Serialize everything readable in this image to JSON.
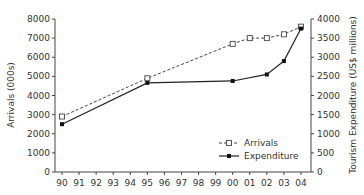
{
  "chart_data": {
    "type": "line",
    "title": "",
    "x": [
      "90",
      "91",
      "92",
      "93",
      "94",
      "95",
      "96",
      "97",
      "98",
      "99",
      "00",
      "01",
      "02",
      "03",
      "04"
    ],
    "xlabel": "",
    "ylabel": "Arrivals (000s)",
    "y2label": "Tourism Expenditure (US$ millions)",
    "ylim": [
      0,
      8000
    ],
    "y2lim": [
      0,
      4000
    ],
    "yticks": [
      0,
      1000,
      2000,
      3000,
      4000,
      5000,
      6000,
      7000,
      8000
    ],
    "y2ticks": [
      0,
      500,
      1000,
      1500,
      2000,
      2500,
      3000,
      3500,
      4000
    ],
    "grid": false,
    "legend_position": "lower right",
    "series": [
      {
        "name": "Arrivals",
        "axis": "left",
        "style": "dashed-open-square",
        "points": [
          [
            "90",
            2900
          ],
          [
            "95",
            4900
          ],
          [
            "00",
            6700
          ],
          [
            "01",
            7000
          ],
          [
            "02",
            7000
          ],
          [
            "03",
            7200
          ],
          [
            "04",
            7600
          ]
        ]
      },
      {
        "name": "Expenditure",
        "axis": "right",
        "style": "solid-filled-square",
        "points": [
          [
            "90",
            1250
          ],
          [
            "95",
            2330
          ],
          [
            "00",
            2380
          ],
          [
            "02",
            2550
          ],
          [
            "03",
            2900
          ],
          [
            "04",
            3750
          ]
        ]
      }
    ]
  },
  "legend": {
    "arrivals_label": "Arrivals",
    "expenditure_label": "Expenditure"
  },
  "axes": {
    "left_label": "Arrivals (000s)",
    "right_label": "Tourism Expenditure (US$ millions)"
  }
}
